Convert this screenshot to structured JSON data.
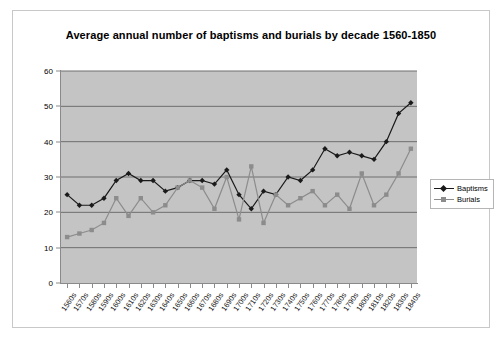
{
  "chart_data": {
    "type": "line",
    "title": "Average annual number of baptisms and burials by decade 1560-1850",
    "xlabel": "",
    "ylabel": "",
    "ylim": [
      0,
      60
    ],
    "yticks": [
      0,
      10,
      20,
      30,
      40,
      50,
      60
    ],
    "grid": true,
    "legend_position": "right",
    "plot_background": "#c4c4c4",
    "categories": [
      "1560s",
      "1570s",
      "1580s",
      "1590s",
      "1600s",
      "1610s",
      "1620s",
      "1630s",
      "1640s",
      "1650s",
      "1660s",
      "1670s",
      "1680s",
      "1690s",
      "1700s",
      "1710s",
      "1720s",
      "1730s",
      "1740s",
      "1750s",
      "1760s",
      "1770s",
      "1780s",
      "1790s",
      "1800s",
      "1810s",
      "1820s",
      "1830s",
      "1840s"
    ],
    "series": [
      {
        "name": "Baptisms",
        "color": "#1a1a1a",
        "marker": "diamond",
        "values": [
          25,
          22,
          22,
          24,
          29,
          31,
          29,
          29,
          26,
          27,
          29,
          29,
          28,
          32,
          25,
          21,
          26,
          25,
          30,
          29,
          32,
          38,
          36,
          37,
          36,
          35,
          40,
          48,
          51
        ]
      },
      {
        "name": "Burials",
        "color": "#8c8c8c",
        "marker": "square",
        "values": [
          13,
          14,
          15,
          17,
          24,
          19,
          24,
          20,
          22,
          27,
          29,
          27,
          21,
          30,
          18,
          33,
          17,
          25,
          22,
          24,
          26,
          22,
          25,
          21,
          31,
          22,
          25,
          31,
          38
        ]
      }
    ]
  },
  "legend": {
    "items": [
      {
        "label": "Baptisms"
      },
      {
        "label": "Burials"
      }
    ]
  }
}
